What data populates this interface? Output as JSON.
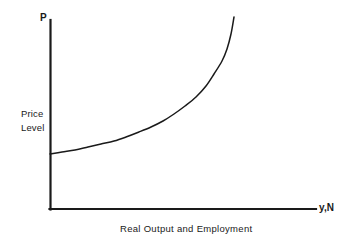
{
  "figure": {
    "axes": {
      "y_title": "P",
      "x_title": "y,N",
      "y_desc_line1": "Price",
      "y_desc_line2": "Level",
      "x_caption": "Real Output and Employment"
    },
    "colors": {
      "background": "#ffffff",
      "axis": "#1a1a1a",
      "curve": "#1a1a1a",
      "text": "#1a1a1a"
    }
  },
  "chart_data": {
    "type": "line",
    "title": "",
    "subtitle": "",
    "xlabel": "Real Output and Employment",
    "ylabel": "Price Level",
    "x_axis_symbol": "y,N",
    "y_axis_symbol": "P",
    "grid": false,
    "legend": null,
    "legend_position": "none",
    "axis_ticks": {
      "x": [],
      "y": []
    },
    "xlim": [
      0,
      1
    ],
    "ylim": [
      0,
      1
    ],
    "annotations": [],
    "series": [
      {
        "name": "Short-Run Aggregate Supply",
        "description": "Upward sloping convex curve, shallow at low output and near-vertical as output approaches capacity",
        "x": [
          0.0,
          0.07,
          0.15,
          0.23,
          0.31,
          0.39,
          0.46,
          0.54,
          0.61,
          0.68,
          0.74,
          0.79,
          0.84,
          0.88,
          0.91,
          0.94,
          0.96,
          0.98,
          1.0
        ],
        "y": [
          0.29,
          0.31,
          0.33,
          0.35,
          0.38,
          0.41,
          0.44,
          0.48,
          0.52,
          0.57,
          0.62,
          0.67,
          0.72,
          0.78,
          0.83,
          0.88,
          0.92,
          0.96,
          1.0
        ],
        "pixel_points": [
          [
            50,
            154
          ],
          [
            62,
            152
          ],
          [
            75,
            150
          ],
          [
            88,
            147
          ],
          [
            101,
            144
          ],
          [
            114,
            141
          ],
          [
            126,
            137
          ],
          [
            139,
            132
          ],
          [
            151,
            127
          ],
          [
            163,
            121
          ],
          [
            174,
            114
          ],
          [
            185,
            106
          ],
          [
            196,
            97
          ],
          [
            206,
            86
          ],
          [
            214,
            74
          ],
          [
            222,
            61
          ],
          [
            227,
            49
          ],
          [
            231,
            34
          ],
          [
            234,
            17
          ]
        ]
      }
    ]
  }
}
